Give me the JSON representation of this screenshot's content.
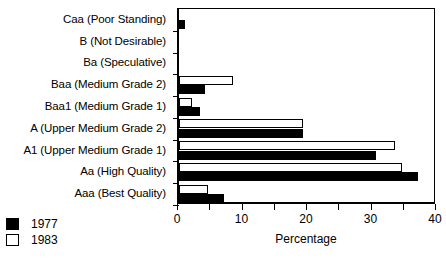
{
  "chart_data": {
    "type": "bar",
    "orientation": "horizontal",
    "title": "",
    "xlabel": "Percentage",
    "ylabel": "",
    "xlim": [
      0,
      40
    ],
    "xticks": [
      0,
      5,
      10,
      15,
      20,
      25,
      30,
      35,
      40
    ],
    "xtick_labels": [
      "0",
      "",
      "10",
      "",
      "20",
      "",
      "30",
      "",
      "40"
    ],
    "grid": false,
    "legend_position": "bottom-left",
    "categories": [
      "Caa (Poor Standing)",
      "B (Not Desirable)",
      "Ba (Speculative)",
      "Baa (Medium Grade 2)",
      "Baa1 (Medium Grade 1)",
      "A (Upper Medium Grade 2)",
      "A1 (Upper Medium Grade 1)",
      "Aa (High Quality)",
      "Aaa (Best Quality)"
    ],
    "series": [
      {
        "name": "1977",
        "color": "#000000",
        "values": [
          1.0,
          0,
          0,
          4.0,
          3.3,
          19.2,
          30.5,
          37.0,
          7.0
        ]
      },
      {
        "name": "1983",
        "color": "#ffffff",
        "values": [
          0,
          0,
          0,
          8.4,
          2.0,
          19.2,
          33.5,
          34.5,
          4.5
        ]
      }
    ]
  },
  "legend": {
    "items": [
      {
        "label": "1977",
        "style": "filled"
      },
      {
        "label": "1983",
        "style": "hollow"
      }
    ]
  }
}
